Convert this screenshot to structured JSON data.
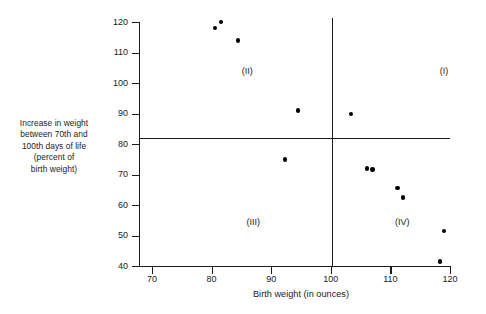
{
  "chart_data": {
    "type": "scatter",
    "title": "",
    "xlabel": "Birth weight (in ounces)",
    "ylabel": "Increase in  weight\nbetween 70th and\n100th days of life\n(percent of\nbirth weight)",
    "xlim": [
      70,
      120
    ],
    "ylim": [
      40,
      120
    ],
    "xticks": [
      70,
      80,
      90,
      100,
      110,
      120
    ],
    "yticks": [
      40,
      50,
      60,
      70,
      80,
      90,
      100,
      110,
      120
    ],
    "grid": false,
    "legend": null,
    "points": [
      {
        "x": 80.6,
        "y": 118.0
      },
      {
        "x": 81.6,
        "y": 120.0
      },
      {
        "x": 84.4,
        "y": 114.0
      },
      {
        "x": 94.5,
        "y": 91.0
      },
      {
        "x": 103.4,
        "y": 89.8
      },
      {
        "x": 92.3,
        "y": 75.0
      },
      {
        "x": 106.1,
        "y": 72.0
      },
      {
        "x": 107.0,
        "y": 71.6
      },
      {
        "x": 111.2,
        "y": 65.6
      },
      {
        "x": 112.1,
        "y": 62.5
      },
      {
        "x": 119.0,
        "y": 51.5
      },
      {
        "x": 118.3,
        "y": 41.5
      }
    ],
    "reference_lines": {
      "vertical_x": 100.2,
      "horizontal_y": 82.0
    },
    "annotations": [
      {
        "label": "(I)",
        "x": 119.0,
        "y": 104.0
      },
      {
        "label": "(II)",
        "x": 86.0,
        "y": 104.0
      },
      {
        "label": "(III)",
        "x": 87.0,
        "y": 54.5
      },
      {
        "label": "(IV)",
        "x": 112.0,
        "y": 54.5
      }
    ]
  },
  "caption": ""
}
